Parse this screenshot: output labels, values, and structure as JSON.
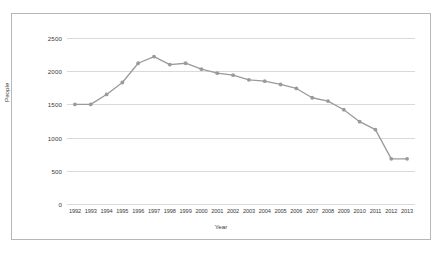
{
  "chart_data": {
    "type": "line",
    "title": "",
    "xlabel": "Year",
    "ylabel": "People",
    "categories": [
      "1992",
      "1993",
      "1994",
      "1995",
      "1996",
      "1997",
      "1998",
      "1999",
      "2000",
      "2001",
      "2002",
      "2003",
      "2004",
      "2005",
      "2006",
      "2007",
      "2008",
      "2009",
      "2010",
      "2011",
      "2012",
      "2013"
    ],
    "values": [
      1500,
      1500,
      1650,
      1830,
      2120,
      2220,
      2100,
      2120,
      2030,
      1970,
      1940,
      1870,
      1850,
      1800,
      1740,
      1600,
      1550,
      1420,
      1240,
      1120,
      680,
      680
    ],
    "series": [
      {
        "name": "People",
        "values": [
          1500,
          1500,
          1650,
          1830,
          2120,
          2220,
          2100,
          2120,
          2030,
          1970,
          1940,
          1870,
          1850,
          1800,
          1740,
          1600,
          1550,
          1420,
          1240,
          1120,
          680,
          680
        ]
      }
    ],
    "ylim": [
      0,
      2500
    ],
    "yticks": [
      0,
      500,
      1000,
      1500,
      2000,
      2500
    ],
    "ytick_labels": [
      "0",
      "500",
      "1000",
      "1500",
      "2000",
      "2500"
    ],
    "grid": true,
    "grid_axis": "y",
    "legend": false,
    "legend_position": "none",
    "markers": true,
    "series_color": "#9a9a9a",
    "grid_color": "#d9d9d9",
    "frame_color": "#b7b7b7",
    "text_color": "#3a3a3a",
    "background": "#ffffff"
  }
}
